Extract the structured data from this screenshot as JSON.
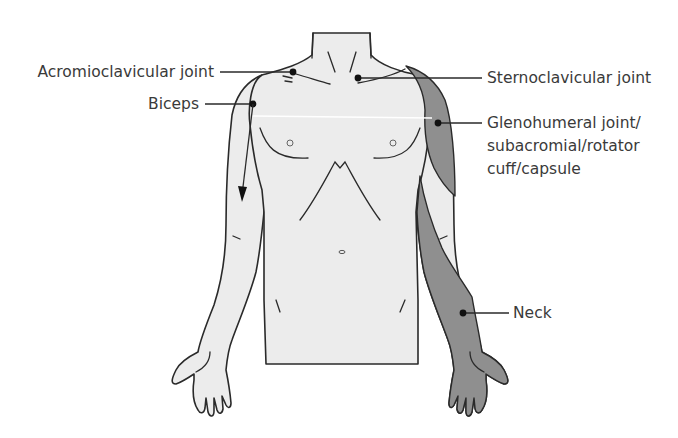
{
  "figure": {
    "colors": {
      "background": "#ffffff",
      "skin_fill": "#ececec",
      "referred_pain_shading": "#8f8f8f",
      "outline": "#2a2a2a",
      "label_text": "#3a3a3a"
    },
    "labels": {
      "acromioclavicular": "Acromioclavicular joint",
      "biceps": "Biceps",
      "sternoclavicular": "Sternoclavicular joint",
      "glenohumeral_line1": "Glenohumeral joint/",
      "glenohumeral_line2": "subacromial/rotator",
      "glenohumeral_line3": "cuff/capsule",
      "neck": "Neck"
    },
    "annotations": [
      {
        "label": "Acromioclavicular joint",
        "side": "left",
        "marker": "dot",
        "target": "left acromioclavicular joint"
      },
      {
        "label": "Biceps",
        "side": "left",
        "marker": "dot-with-downward-arrow",
        "target": "upper arm, pain radiating down anterior arm"
      },
      {
        "label": "Sternoclavicular joint",
        "side": "right",
        "marker": "dot",
        "target": "sternoclavicular joint"
      },
      {
        "label": "Glenohumeral joint/subacromial/rotator cuff/capsule",
        "side": "right",
        "marker": "dot",
        "target": "shaded lateral shoulder/deltoid region"
      },
      {
        "label": "Neck",
        "side": "right",
        "marker": "dot",
        "target": "shaded forearm and hand (referred from neck)"
      }
    ]
  }
}
